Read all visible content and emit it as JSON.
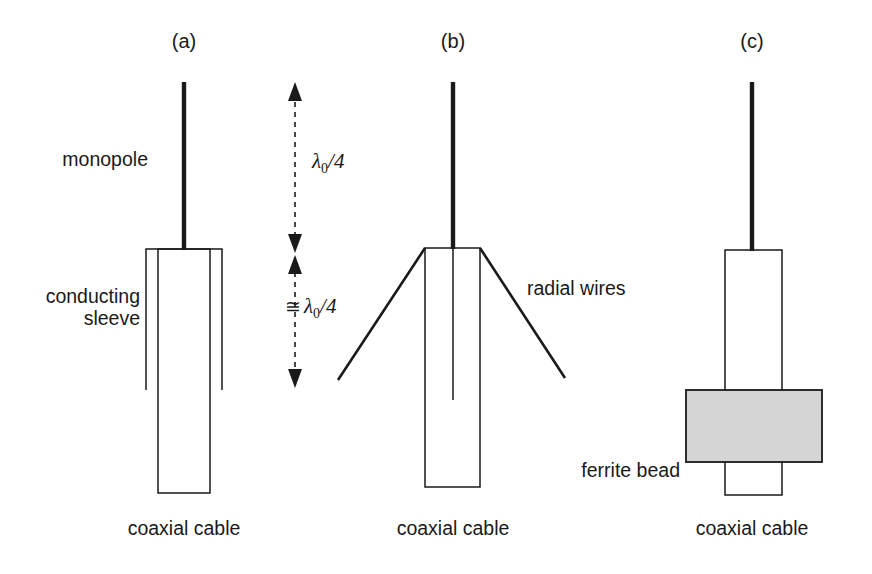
{
  "figure": {
    "background_color": "#ffffff",
    "line_color": "#1a1a1a",
    "ferrite_fill_color": "#d5d5d5"
  },
  "panels": [
    {
      "id": "a",
      "label": "(a)",
      "label_x": 184,
      "label_y": 48,
      "monopole": {
        "x": 184,
        "y_top": 82,
        "y_bottom": 250
      },
      "coax_box": {
        "x_left": 158,
        "x_right": 210,
        "y_top": 249,
        "y_bottom": 493
      },
      "sleeve": {
        "x_left": 146,
        "x_right": 222,
        "y_top": 249,
        "y_bottom": 390
      },
      "labels": [
        {
          "name": "monopole-label",
          "text": "monopole",
          "x": 148,
          "y": 166,
          "anchor": "end"
        },
        {
          "name": "conducting-sleeve-label-line1",
          "text": "conducting",
          "x": 140,
          "y": 303,
          "anchor": "end"
        },
        {
          "name": "conducting-sleeve-label-line2",
          "text": "sleeve",
          "x": 140,
          "y": 325,
          "anchor": "end"
        },
        {
          "name": "coaxial-cable-label",
          "text": "coaxial cable",
          "x": 184,
          "y": 535,
          "anchor": "middle"
        }
      ]
    },
    {
      "id": "b",
      "label": "(b)",
      "label_x": 453,
      "label_y": 48,
      "monopole": {
        "x": 453,
        "y_top": 82,
        "y_bottom": 249
      },
      "coax_box": {
        "x_left": 425,
        "x_right": 480,
        "y_top": 248,
        "y_bottom": 487
      },
      "inner_conductor": {
        "x": 453,
        "y_top": 249,
        "y_bottom": 400
      },
      "radial_wires": [
        {
          "x1": 425,
          "y1": 248,
          "x2": 338,
          "y2": 380
        },
        {
          "x1": 480,
          "y1": 248,
          "x2": 565,
          "y2": 378
        }
      ],
      "labels": [
        {
          "name": "radial-wires-label",
          "text": "radial wires",
          "x": 527,
          "y": 295,
          "anchor": "start"
        },
        {
          "name": "coaxial-cable-label",
          "text": "coaxial cable",
          "x": 453,
          "y": 535,
          "anchor": "middle"
        }
      ]
    },
    {
      "id": "c",
      "label": "(c)",
      "label_x": 752,
      "label_y": 48,
      "monopole": {
        "x": 752,
        "y_top": 82,
        "y_bottom": 251
      },
      "coax_box": {
        "x_left": 725,
        "x_right": 782,
        "y_top": 250,
        "y_bottom": 495
      },
      "ferrite_bead": {
        "x_left": 686,
        "x_right": 822,
        "y_top": 390,
        "y_bottom": 462
      },
      "labels": [
        {
          "name": "ferrite-bead-label",
          "text": "ferrite bead",
          "x": 680,
          "y": 477,
          "anchor": "end"
        },
        {
          "name": "coaxial-cable-label",
          "text": "coaxial cable",
          "x": 752,
          "y": 535,
          "anchor": "middle"
        }
      ]
    }
  ],
  "dimensions": {
    "axis_x": 295,
    "upper": {
      "name": "quarter-wavelength-upper",
      "symbol": "λ",
      "subscript": "0",
      "divisor": "/4",
      "approx": "",
      "text": "λ0/4",
      "y_top": 82,
      "y_bottom": 253,
      "label_x": 312,
      "label_y": 168
    },
    "lower": {
      "name": "quarter-wavelength-lower",
      "symbol": "λ",
      "subscript": "0",
      "divisor": "/4",
      "approx": "≅",
      "text": "≅ λ0/4",
      "y_top": 253,
      "y_bottom": 388,
      "label_x": 288,
      "label_y": 313
    }
  }
}
